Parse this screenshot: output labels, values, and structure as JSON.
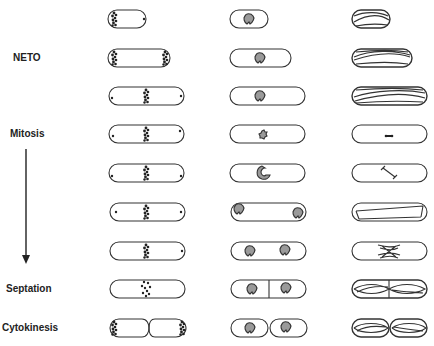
{
  "labels": {
    "neto": "NETO",
    "mitosis": "Mitosis",
    "septation": "Septation",
    "cytokinesis": "Cytokinesis"
  },
  "columns": [
    {
      "name": "nuclei",
      "description": "DNA / chromosome staining"
    },
    {
      "name": "spindle-pole-body",
      "description": "nucleolus / SPB staining"
    },
    {
      "name": "microtubules",
      "description": "microtubule arrays"
    }
  ],
  "rows": [
    {
      "stage": "interphase-early",
      "col3": "cytoplasmic microtubules"
    },
    {
      "stage": "NETO",
      "col3": "cytoplasmic microtubules"
    },
    {
      "stage": "G2",
      "col3": "cytoplasmic microtubules"
    },
    {
      "stage": "mitosis-early",
      "col3": "short spindle"
    },
    {
      "stage": "mitosis-metaphase",
      "col3": "spindle elongating"
    },
    {
      "stage": "anaphase",
      "col3": "long spindle"
    },
    {
      "stage": "post-anaphase",
      "col3": "post-anaphase array"
    },
    {
      "stage": "septation",
      "col3": "cytoplasmic microtubules with septum"
    },
    {
      "stage": "cytokinesis",
      "col3": "cytoplasmic microtubules, separated cells"
    }
  ],
  "colors": {
    "outline": "#333333",
    "fill_gray": "#9a9a9a",
    "dots": "#222222"
  }
}
